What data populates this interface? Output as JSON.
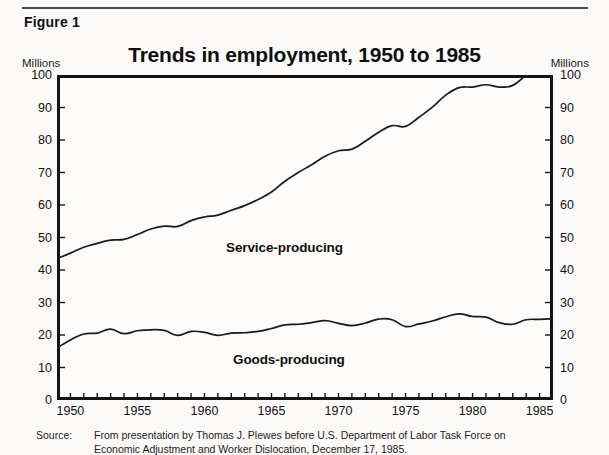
{
  "figure": {
    "label": "Figure 1"
  },
  "axis_unit_left": "Millions",
  "axis_unit_right": "Millions",
  "source": {
    "key": "Source:",
    "line1": "From presentation by Thomas J. Plewes before U.S. Department of Labor Task Force on",
    "line2": "Economic Adjustment and Worker Dislocation, December 17, 1985."
  },
  "colors": {
    "frame": "#141414",
    "line": "#1a1a1a",
    "background": "#fbfaf8",
    "rule": "#4a4a4a"
  },
  "chart_data": {
    "type": "line",
    "title": "Trends in employment, 1950 to 1985",
    "xlabel": "",
    "ylabel": "Millions",
    "ylabel_right": "Millions",
    "xlim": [
      1949,
      1986
    ],
    "ylim": [
      0,
      100
    ],
    "yticks": [
      0,
      10,
      20,
      30,
      40,
      50,
      60,
      70,
      80,
      90,
      100
    ],
    "xticks_labeled": [
      1950,
      1955,
      1960,
      1965,
      1970,
      1975,
      1980,
      1985
    ],
    "xtick_interval_minor": 1,
    "grid": false,
    "legend": "inline-annotations",
    "x": [
      1949,
      1950,
      1951,
      1952,
      1953,
      1954,
      1955,
      1956,
      1957,
      1958,
      1959,
      1960,
      1961,
      1962,
      1963,
      1964,
      1965,
      1966,
      1967,
      1968,
      1969,
      1970,
      1971,
      1972,
      1973,
      1974,
      1975,
      1976,
      1977,
      1978,
      1979,
      1980,
      1981,
      1982,
      1983,
      1984,
      1985,
      1986
    ],
    "series": [
      {
        "name": "Service-producing",
        "values": [
          43.5,
          45.2,
          47.0,
          48.2,
          49.2,
          49.4,
          50.9,
          52.6,
          53.5,
          53.4,
          55.2,
          56.3,
          56.9,
          58.4,
          59.8,
          61.7,
          64.0,
          67.3,
          70.0,
          72.4,
          75.0,
          76.7,
          77.2,
          79.6,
          82.4,
          84.4,
          84.2,
          87.0,
          90.1,
          93.8,
          96.1,
          96.3,
          97.0,
          96.3,
          96.8,
          100.0,
          103.0,
          106.0
        ],
        "label_position": {
          "x": 226,
          "y": 240
        }
      },
      {
        "name": "Goods-producing",
        "values": [
          16.0,
          18.5,
          20.3,
          20.6,
          21.8,
          20.4,
          21.3,
          21.6,
          21.4,
          19.9,
          21.1,
          20.8,
          19.9,
          20.6,
          20.7,
          21.1,
          22.0,
          23.1,
          23.3,
          23.8,
          24.4,
          23.6,
          22.9,
          23.7,
          24.9,
          24.7,
          22.6,
          23.4,
          24.3,
          25.6,
          26.5,
          25.7,
          25.5,
          23.8,
          23.3,
          24.7,
          24.8,
          25.0
        ],
        "label_position": {
          "x": 233,
          "y": 352
        }
      }
    ]
  }
}
